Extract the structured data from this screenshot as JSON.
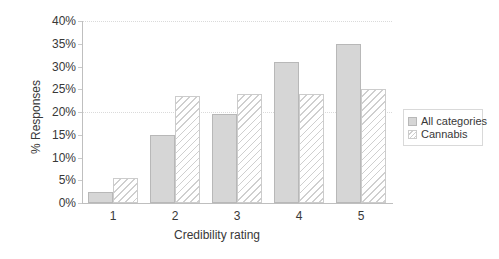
{
  "chart_data": {
    "type": "bar",
    "title": "",
    "xlabel": "Credibility rating",
    "ylabel": "% Responses",
    "categories": [
      "1",
      "2",
      "3",
      "4",
      "5"
    ],
    "series": [
      {
        "name": "All categories",
        "values": [
          2.5,
          15,
          19.5,
          31,
          35
        ],
        "style": "solid",
        "fill": "#d6d6d6",
        "border": "#b8b8b8"
      },
      {
        "name": "Cannabis",
        "values": [
          5.5,
          23.5,
          24,
          24,
          25
        ],
        "style": "hatched",
        "fill": "#ffffff",
        "hatch_color": "#cfcfcf",
        "border": "#cccccc"
      }
    ],
    "ylim": [
      0,
      40
    ],
    "ytick_step": 5,
    "ytick_labels": [
      "0%",
      "5%",
      "10%",
      "15%",
      "20%",
      "25%",
      "30%",
      "35%",
      "40%"
    ],
    "gridlines_at_percent": [
      20,
      40
    ],
    "grid_style": "dotted",
    "legend_position": "right",
    "axis_color": "#bfbfbf",
    "text_color": "#383838"
  }
}
